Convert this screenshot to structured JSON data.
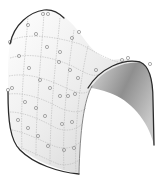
{
  "figure": {
    "colors": {
      "background": "#ffffff",
      "surface_light": "#f4f4f4",
      "surface_mid": "#d8d8d8",
      "surface_dark": "#9a9a9a",
      "edge": "#2a2a2a",
      "grid": "#b8b8b8",
      "control_point": "#8a8a8a"
    }
  }
}
